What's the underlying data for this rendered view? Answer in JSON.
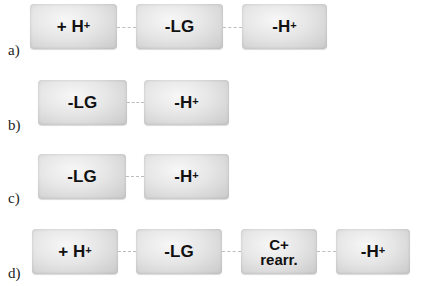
{
  "rows": [
    {
      "label": "a)",
      "steps": [
        {
          "main": "+ H",
          "sup": "+"
        },
        {
          "main": "-LG",
          "sup": ""
        },
        {
          "main": "-H",
          "sup": "+"
        }
      ]
    },
    {
      "label": "b)",
      "steps": [
        {
          "main": "-LG",
          "sup": ""
        },
        {
          "main": "-H",
          "sup": "+"
        }
      ]
    },
    {
      "label": "c)",
      "steps": [
        {
          "main": "-LG",
          "sup": ""
        },
        {
          "main": "-H",
          "sup": "+"
        }
      ]
    },
    {
      "label": "d)",
      "steps": [
        {
          "main": "+ H",
          "sup": "+"
        },
        {
          "main": "-LG",
          "sup": ""
        },
        {
          "line1": "C+",
          "line2": "rearr."
        },
        {
          "main": "-H",
          "sup": "+"
        }
      ]
    }
  ]
}
